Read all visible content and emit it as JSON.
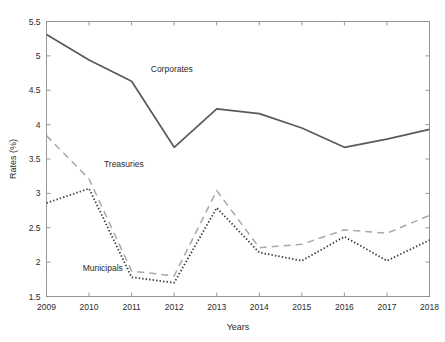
{
  "chart_data": {
    "type": "line",
    "title": "",
    "xlabel": "Years",
    "ylabel": "Rates (%)",
    "x": [
      2009,
      2010,
      2011,
      2012,
      2013,
      2014,
      2015,
      2016,
      2017,
      2018
    ],
    "xtick_labels": [
      "2009",
      "2010",
      "2011",
      "2012",
      "2013",
      "2014",
      "2015",
      "2016",
      "2017",
      "2018"
    ],
    "ytick_labels": [
      "1.5",
      "2",
      "2.5",
      "3",
      "3.5",
      "4",
      "4.5",
      "5",
      "5.5"
    ],
    "ytick_values": [
      1.5,
      2,
      2.5,
      3,
      3.5,
      4,
      4.5,
      5,
      5.5
    ],
    "xlim": [
      2009,
      2018
    ],
    "ylim": [
      1.5,
      5.5
    ],
    "grid": false,
    "legend_position": "inline-annotations",
    "series": [
      {
        "name": "Corporates",
        "style": "solid",
        "color": "#5a5a5a",
        "label_x": 2011.45,
        "label_y": 4.76,
        "values": [
          5.31,
          4.94,
          4.63,
          3.67,
          4.23,
          4.16,
          3.95,
          3.67,
          3.79,
          3.93
        ]
      },
      {
        "name": "Treasuries",
        "style": "dashed",
        "color": "#a8a8a8",
        "label_x": 2010.35,
        "label_y": 3.39,
        "values": [
          3.84,
          3.21,
          1.87,
          1.8,
          3.04,
          2.21,
          2.26,
          2.47,
          2.42,
          2.68
        ]
      },
      {
        "name": "Municipals",
        "style": "dotted",
        "color": "#3a3a3a",
        "label_x": 2009.85,
        "label_y": 1.87,
        "values": [
          2.86,
          3.07,
          1.78,
          1.7,
          2.79,
          2.14,
          2.02,
          2.37,
          2.02,
          2.32
        ]
      }
    ],
    "axis_color": "#8c8c8c"
  }
}
